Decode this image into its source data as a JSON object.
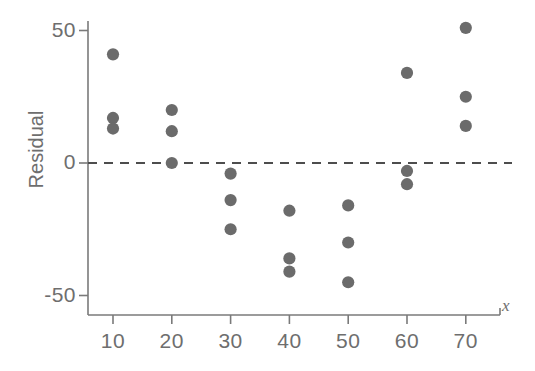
{
  "figure": {
    "background_color": "#ffffff",
    "axis_color": "#7a7a7a",
    "text_color": "#6e6e6e",
    "point_color": "#6b6b6b",
    "zero_line_color": "#4d4d4d"
  },
  "axes": {
    "y_title": "Residual",
    "x_title": "x",
    "y_ticks": [
      "50",
      "0",
      "-50"
    ],
    "x_ticks": [
      "10",
      "20",
      "30",
      "40",
      "50",
      "60",
      "70"
    ]
  },
  "chart_data": {
    "type": "scatter",
    "title": "",
    "xlabel": "x",
    "ylabel": "Residual",
    "xlim": [
      0,
      75
    ],
    "ylim": [
      -60,
      58
    ],
    "grid": false,
    "legend": null,
    "reference_line": {
      "orientation": "horizontal",
      "value": 0,
      "style": "dashed"
    },
    "x": [
      10,
      10,
      10,
      20,
      20,
      20,
      30,
      30,
      30,
      40,
      40,
      40,
      50,
      50,
      50,
      60,
      60,
      60,
      70,
      70,
      70
    ],
    "y": [
      41,
      17,
      13,
      20,
      12,
      0,
      -4,
      -14,
      -25,
      -18,
      -36,
      -41,
      -16,
      -30,
      -45,
      34,
      -3,
      -8,
      51,
      25,
      14
    ],
    "points": [
      {
        "x": 10,
        "y": 41
      },
      {
        "x": 10,
        "y": 17
      },
      {
        "x": 10,
        "y": 13
      },
      {
        "x": 20,
        "y": 20
      },
      {
        "x": 20,
        "y": 12
      },
      {
        "x": 20,
        "y": 0
      },
      {
        "x": 30,
        "y": -4
      },
      {
        "x": 30,
        "y": -14
      },
      {
        "x": 30,
        "y": -25
      },
      {
        "x": 40,
        "y": -18
      },
      {
        "x": 40,
        "y": -36
      },
      {
        "x": 40,
        "y": -41
      },
      {
        "x": 50,
        "y": -16
      },
      {
        "x": 50,
        "y": -30
      },
      {
        "x": 50,
        "y": -45
      },
      {
        "x": 60,
        "y": 34
      },
      {
        "x": 60,
        "y": -3
      },
      {
        "x": 60,
        "y": -8
      },
      {
        "x": 70,
        "y": 51
      },
      {
        "x": 70,
        "y": 25
      },
      {
        "x": 70,
        "y": 14
      }
    ]
  }
}
